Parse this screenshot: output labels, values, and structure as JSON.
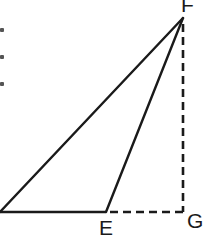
{
  "diagram": {
    "type": "geometry-triangle",
    "stroke_color": "#1a1a1a",
    "background": "#ffffff",
    "points": {
      "left": {
        "x": 0,
        "y": 212
      },
      "E": {
        "x": 106,
        "y": 212
      },
      "F": {
        "x": 183,
        "y": 18
      },
      "G": {
        "x": 183,
        "y": 212
      }
    },
    "labels": {
      "F": "F",
      "E": "E",
      "G": "G"
    },
    "segments": [
      {
        "from": "left",
        "to": "F",
        "style": "solid"
      },
      {
        "from": "E",
        "to": "F",
        "style": "solid"
      },
      {
        "from": "left",
        "to": "E",
        "style": "solid"
      },
      {
        "from": "F",
        "to": "G",
        "style": "dashed"
      },
      {
        "from": "E",
        "to": "G",
        "style": "dashed"
      }
    ]
  }
}
